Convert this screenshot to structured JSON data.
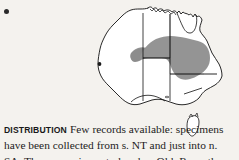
{
  "page": {
    "background_color": "#f4f2ee",
    "width": 239,
    "height": 160
  },
  "caption": {
    "bullet": "●",
    "heading": "DISTRIBUTION",
    "body": "Few records available: specimens have been collected from s. NT and just into n. SA. They occur in central and w. Qld. Recently recorded from central NSW.",
    "lines": [
      "Few",
      "records available:",
      "specimens",
      "have been",
      "collected from",
      "s. NT and just",
      "into n. SA. They",
      "occur in central and w. Qld.",
      "Recently recorded from central",
      "NSW."
    ],
    "text_color": "#1c1c1c"
  },
  "map": {
    "name": "australia-distribution-map",
    "region": "Australia",
    "coastline_color": "#111111",
    "state_border_color": "#111111",
    "land_fill": "#ffffff",
    "range_fill": "#8c8c8c",
    "range_description": "Shaded range covering southern Northern Territory, northern South Australia, and central to western Queensland, extending into central New South Wales.",
    "features": [
      "mainland-outline",
      "tasmania",
      "state-borders",
      "west-coast-locality-dot",
      "shaded-range"
    ],
    "locality_dot_color": "#1a1a1a"
  }
}
